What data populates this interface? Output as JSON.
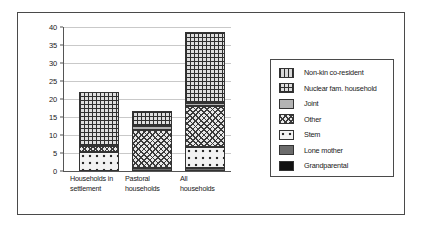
{
  "chart_data": {
    "type": "bar",
    "stacked": true,
    "title": "",
    "subtitle": "",
    "xlabel": "",
    "ylabel": "",
    "ylim": [
      0,
      40
    ],
    "ytick_step": 5,
    "yticks": [
      "40",
      "35",
      "30",
      "25",
      "20",
      "15",
      "10",
      "5",
      "0"
    ],
    "grid": true,
    "legend_position": "right",
    "categories": [
      "Households in settlement",
      "Pastoral households",
      "All households"
    ],
    "category_lines": [
      [
        "Households in",
        "settlement"
      ],
      [
        "Pastoral",
        "households"
      ],
      [
        "All",
        "households"
      ]
    ],
    "series": [
      {
        "name": "Grandparental",
        "pattern": "solid-black",
        "color": "#111111",
        "values": [
          0,
          0,
          0
        ]
      },
      {
        "name": "Lone mother",
        "pattern": "solid-dark-gray",
        "color": "#6b6b6b",
        "values": [
          0,
          0.9,
          0.8
        ]
      },
      {
        "name": "Stem",
        "pattern": "sparse-circles",
        "color": "#f2f2f2",
        "values": [
          5.3,
          0,
          6.0
        ]
      },
      {
        "name": "Other",
        "pattern": "dense-crosshatch",
        "color": "#e8e8e8",
        "values": [
          1.7,
          10.6,
          11.2
        ]
      },
      {
        "name": "Joint",
        "pattern": "solid-light-gray",
        "color": "#b3b3b3",
        "values": [
          0,
          1.1,
          1.0
        ]
      },
      {
        "name": "Nuclear fam. household",
        "pattern": "grid",
        "color": "#dedede",
        "values": [
          15.0,
          4.0,
          19.7
        ]
      },
      {
        "name": "Non-kin co-resident",
        "pattern": "vertical-lines",
        "color": "#d9d9d9",
        "values": [
          0,
          0,
          0
        ]
      }
    ],
    "totals": [
      22.0,
      16.6,
      38.7
    ]
  },
  "legend": {
    "items": [
      {
        "label": "Non-kin co-resident"
      },
      {
        "label": "Nuclear fam. household"
      },
      {
        "label": "Joint"
      },
      {
        "label": "Other"
      },
      {
        "label": "Stem"
      },
      {
        "label": "Lone mother"
      },
      {
        "label": "Grandparental"
      }
    ]
  }
}
